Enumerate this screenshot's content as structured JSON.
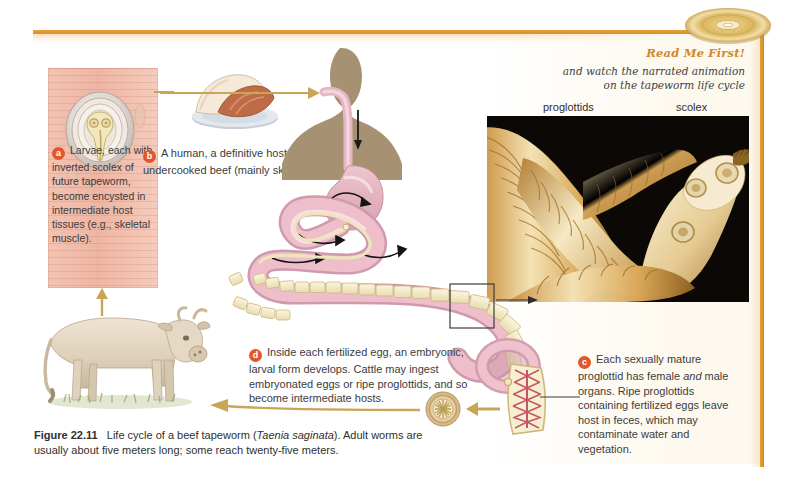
{
  "figure": {
    "number": "Figure 22.11",
    "caption_text": "Life cycle of a beef tapeworm (",
    "species_italic": "Taenia saginata",
    "caption_text_2": "). Adult worms are usually about five meters long; some reach twenty-five meters."
  },
  "read_me_first": {
    "title": "Read Me First!",
    "line1": "and watch the narrated animation",
    "line2": "on the tapeworm life cycle",
    "disc_icon": "cd-disc-icon"
  },
  "photo": {
    "label_proglottids": "proglottids",
    "label_scolex": "scolex",
    "alt": "scanning electron micrograph of tapeworm scolex and proglottids"
  },
  "steps": {
    "a": {
      "letter": "a",
      "text": "Larvae, each with inverted scolex of future tapeworm, become encysted in intermediate host tissues (e.g., skeletal muscle)."
    },
    "b": {
      "letter": "b",
      "text": "A human, a definitive host, eats infected, undercooked beef (mainly skeletal muscle)."
    },
    "c": {
      "letter": "c",
      "text_1": "Each sexually mature proglottid has female ",
      "text_italic": "and",
      "text_2": " male organs. Ripe proglottids containing fertilized eggs leave host in feces, which may contaminate water and vegetation."
    },
    "d": {
      "letter": "d",
      "text": "Inside each fertilized egg, an embryonic, larval form develops. Cattle may ingest embryonated eggs or ripe proglottids, and so become intermediate hosts."
    }
  },
  "illustrations": {
    "cysticercus": "encysted-larva-illustration",
    "beef_plate": "beef-steak-on-plate-illustration",
    "human": "human-silhouette-digestive-tract-illustration",
    "cow": "cow-illustration",
    "proglottid": "mature-proglottid-detail-illustration",
    "egg": "tapeworm-egg-illustration"
  },
  "colors": {
    "accent_gold": "#e8a13a",
    "bullet_orange": "#e1562a",
    "read_me_first": "#d2872b",
    "intestine_pink": "#e0aebb",
    "proglottid_cream": "#f5edd2",
    "human_tan": "#a69272",
    "muscle_pink": "#eeb5a3",
    "photo_background": "#0a0705"
  }
}
